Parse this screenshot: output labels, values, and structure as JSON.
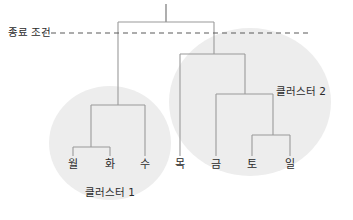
{
  "figure": {
    "type": "dendrogram",
    "width": 353,
    "height": 220,
    "background": "#ffffff",
    "line_color": "#9a9a9a",
    "blob_color": "#ededed",
    "threshold_color": "#5b5b5b"
  },
  "threshold": {
    "label": "종료 조건",
    "label_x": 8,
    "label_y": 36,
    "y": 33,
    "x_start": 42,
    "x_end": 311
  },
  "leaves": [
    {
      "label": "월",
      "x": 73,
      "y": 168,
      "tick_top": 147
    },
    {
      "label": "화",
      "x": 110,
      "y": 168,
      "tick_top": 147
    },
    {
      "label": "수",
      "x": 145,
      "y": 168,
      "tick_top": 105
    },
    {
      "label": "목",
      "x": 180,
      "y": 168,
      "tick_top": 54
    },
    {
      "label": "금",
      "x": 216,
      "y": 168,
      "tick_top": 94
    },
    {
      "label": "토",
      "x": 252,
      "y": 168,
      "tick_top": 135
    },
    {
      "label": "일",
      "x": 290,
      "y": 168,
      "tick_top": 135
    }
  ],
  "merges": [
    {
      "name": "merge-mon-tue",
      "x_left": 73,
      "x_right": 110,
      "y": 147,
      "x_mid": 91,
      "parent_y": 105
    },
    {
      "name": "merge-cluster1",
      "x_left": 91,
      "x_right": 145,
      "y": 105,
      "x_mid": 118,
      "parent_y": 22
    },
    {
      "name": "merge-sat-sun",
      "x_left": 252,
      "x_right": 290,
      "y": 135,
      "x_mid": 273,
      "parent_y": 94
    },
    {
      "name": "merge-fri-satsun",
      "x_left": 216,
      "x_right": 273,
      "y": 94,
      "x_mid": 245,
      "parent_y": 54
    },
    {
      "name": "merge-cluster2",
      "x_left": 180,
      "x_right": 245,
      "y": 54,
      "x_mid": 214,
      "parent_y": 22
    },
    {
      "name": "merge-root",
      "x_left": 118,
      "x_right": 214,
      "y": 22,
      "x_mid": 166,
      "parent_y": 4
    }
  ],
  "root_stub": {
    "x": 166,
    "y_top": 4,
    "y_bottom": 22
  },
  "clusters": [
    {
      "name": "cluster-1",
      "label": "클러스터 1",
      "label_x": 110,
      "label_y": 196,
      "cx": 110,
      "cy": 143,
      "rx": 61,
      "ry": 57
    },
    {
      "name": "cluster-2",
      "label": "클러스터 2",
      "label_x": 301,
      "label_y": 95,
      "cx": 250,
      "cy": 102,
      "rx": 81,
      "ry": 74
    }
  ]
}
